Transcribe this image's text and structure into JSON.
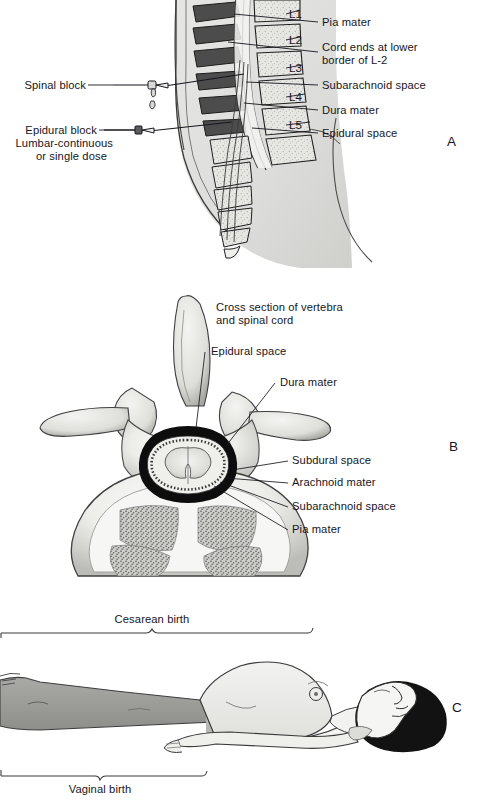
{
  "figure": {
    "title_implicit": "Spinal and epidural anesthesia anatomy",
    "panels": [
      "A",
      "B",
      "C"
    ]
  },
  "panel_a": {
    "letter": "A",
    "left_labels": [
      {
        "id": "spinal-block",
        "text": "Spinal block"
      },
      {
        "id": "epidural-block",
        "text": "Epidural block"
      },
      {
        "id": "epidural-block-line2",
        "text": "Lumbar-continuous"
      },
      {
        "id": "epidural-block-line3",
        "text": "or single dose"
      }
    ],
    "right_labels": [
      {
        "id": "pia-mater",
        "text": "Pia mater"
      },
      {
        "id": "cord-ends-1",
        "text": "Cord ends at lower"
      },
      {
        "id": "cord-ends-2",
        "text": "border of L-2"
      },
      {
        "id": "subarachnoid-space",
        "text": "Subarachnoid space"
      },
      {
        "id": "dura-mater",
        "text": "Dura mater"
      },
      {
        "id": "epidural-space",
        "text": "Epidural space"
      }
    ],
    "vertebrae": [
      "L1",
      "L2",
      "L3",
      "L4",
      "L5"
    ]
  },
  "panel_b": {
    "letter": "B",
    "labels": [
      {
        "id": "cross-section-1",
        "text": "Cross section of vertebra"
      },
      {
        "id": "cross-section-2",
        "text": "and spinal cord"
      },
      {
        "id": "epidural-space",
        "text": "Epidural space"
      },
      {
        "id": "dura-mater",
        "text": "Dura mater"
      },
      {
        "id": "subdural-space",
        "text": "Subdural space"
      },
      {
        "id": "arachnoid-mater",
        "text": "Arachnoid mater"
      },
      {
        "id": "subarachnoid-space",
        "text": "Subarachnoid space"
      },
      {
        "id": "pia-mater",
        "text": "Pia mater"
      }
    ]
  },
  "panel_c": {
    "letter": "C",
    "brackets": [
      {
        "id": "cesarean-birth",
        "text": "Cesarean birth",
        "position": "above"
      },
      {
        "id": "vaginal-birth",
        "text": "Vaginal birth",
        "position": "below"
      }
    ]
  },
  "colors": {
    "ink": "#16161e",
    "bone_light": "#e8e8e6",
    "bone_mid": "#cfcfcb",
    "bone_dark": "#8f8f8c",
    "skin_light": "#e2e2e0",
    "skin_mid": "#c9c9c6",
    "skin_dark": "#9e9e9b",
    "hair_black": "#121212",
    "dura_black": "#0d0d0d",
    "background": "#ffffff"
  }
}
